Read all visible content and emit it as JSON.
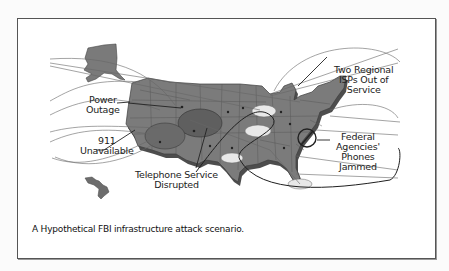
{
  "figure": {
    "caption": "A Hypothetical FBI infrastructure attack scenario.",
    "colors": {
      "map_fill": "#7a7a7a",
      "map_dark": "#4e4e4e",
      "border": "#555555",
      "highlight": "#e6e6e6",
      "line": "#555555"
    },
    "labels": {
      "power_outage": {
        "line1": "Power",
        "line2": "Outage"
      },
      "nine_one_one": {
        "line1": "911",
        "line2": "Unavailable"
      },
      "telephone": {
        "line1": "Telephone Service",
        "line2": "Disrupted"
      },
      "isps": {
        "line1": "Two Regional",
        "line2": "ISPs Out of",
        "line3": "Service"
      },
      "federal": {
        "line1": "Federal",
        "line2": "Agencies'",
        "line3": "Phones",
        "line4": "Jammed"
      }
    },
    "regions": [
      "Alaska",
      "Contiguous United States",
      "Hawaii"
    ]
  }
}
